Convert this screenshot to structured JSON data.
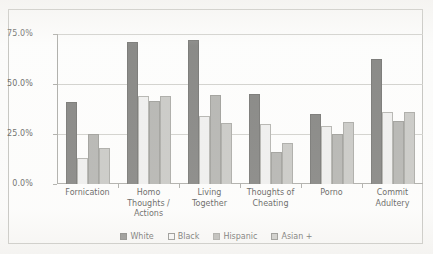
{
  "chart_data": {
    "type": "bar",
    "title": "",
    "xlabel": "",
    "ylabel": "",
    "ylim": [
      0,
      75
    ],
    "grid": true,
    "legend_position": "bottom",
    "categories": [
      "Fornication",
      "Homo Thoughts / Actions",
      "Living Together",
      "Thoughts of Cheating",
      "Porno",
      "Commit Adultery"
    ],
    "ytick_labels": [
      "0.0%",
      "25.0%",
      "50.0%",
      "75.0%"
    ],
    "ytick_values": [
      0,
      25,
      50,
      75
    ],
    "series": [
      {
        "name": "White",
        "color": "#6e6e6b",
        "values": [
          41.0,
          71.0,
          72.0,
          45.0,
          35.0,
          62.5
        ]
      },
      {
        "name": "Black",
        "color": "#ececeb",
        "values": [
          13.0,
          44.0,
          34.0,
          30.0,
          29.0,
          36.0
        ]
      },
      {
        "name": "Hispanic",
        "color": "#a7a7a3",
        "values": [
          25.0,
          41.5,
          44.5,
          16.0,
          25.0,
          31.5
        ]
      },
      {
        "name": "Asian +",
        "color": "#bfbfbb",
        "values": [
          18.0,
          44.0,
          30.5,
          20.5,
          31.0,
          36.0
        ]
      }
    ]
  }
}
